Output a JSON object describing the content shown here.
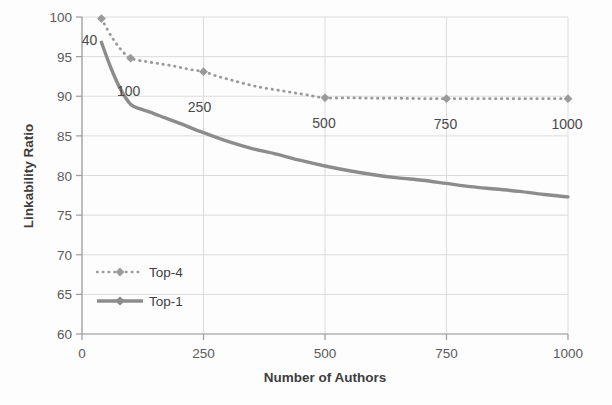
{
  "chart_data": {
    "type": "line",
    "title": "",
    "xlabel": "Number of Authors",
    "ylabel": "Linkability Ratio",
    "xlim": [
      0,
      1000
    ],
    "ylim": [
      60,
      100
    ],
    "xticks": [
      "0",
      "250",
      "500",
      "750",
      "1000"
    ],
    "xtick_values": [
      0,
      250,
      500,
      750,
      1000
    ],
    "yticks": [
      "60",
      "65",
      "70",
      "75",
      "80",
      "85",
      "90",
      "95",
      "100"
    ],
    "ytick_values": [
      60,
      65,
      70,
      75,
      80,
      85,
      90,
      95,
      100
    ],
    "grid": true,
    "legend_position": "inside-lower-left",
    "series": [
      {
        "name": "Top-4",
        "style": "dotted",
        "marker": "diamond",
        "color": "#9a9a9a",
        "x": [
          40,
          100,
          250,
          500,
          750,
          1000
        ],
        "values": [
          99.8,
          94.8,
          93.1,
          89.8,
          89.7,
          89.7
        ],
        "marker_x": [
          40,
          100,
          250,
          500,
          750,
          1000
        ],
        "dense_x": [
          40,
          60,
          80,
          100,
          130,
          160,
          190,
          220,
          250,
          280,
          310,
          340,
          370,
          400,
          430,
          460,
          500,
          550,
          600,
          650,
          700,
          750,
          800,
          850,
          900,
          950,
          1000
        ],
        "dense_values": [
          99.8,
          97.6,
          95.9,
          94.8,
          94.4,
          94.1,
          93.8,
          93.4,
          93.1,
          92.5,
          92.0,
          91.5,
          91.1,
          90.8,
          90.5,
          90.2,
          89.8,
          89.8,
          89.75,
          89.75,
          89.7,
          89.7,
          89.7,
          89.7,
          89.7,
          89.7,
          89.7
        ]
      },
      {
        "name": "Top-1",
        "style": "solid",
        "marker": "none",
        "color": "#8c8c8c",
        "x": [
          40,
          60,
          80,
          100,
          120,
          140,
          170,
          200,
          250,
          300,
          350,
          400,
          450,
          500,
          550,
          600,
          650,
          700,
          750,
          800,
          850,
          900,
          950,
          1000
        ],
        "values": [
          96.8,
          93.5,
          90.8,
          89.0,
          88.4,
          88.0,
          87.3,
          86.6,
          85.4,
          84.3,
          83.4,
          82.7,
          81.9,
          81.2,
          80.6,
          80.1,
          79.7,
          79.4,
          79.0,
          78.6,
          78.3,
          78.0,
          77.6,
          77.3
        ]
      }
    ],
    "annotations": [
      {
        "text": "40",
        "x": 40,
        "y": 99.8
      },
      {
        "text": "100",
        "x": 100,
        "y": 94.8
      },
      {
        "text": "250",
        "x": 250,
        "y": 93.1
      },
      {
        "text": "500",
        "x": 500,
        "y": 89.8
      },
      {
        "text": "750",
        "x": 750,
        "y": 89.7
      },
      {
        "text": "1000",
        "x": 1000,
        "y": 89.7
      }
    ]
  },
  "legend": {
    "entries": [
      {
        "label": "Top-4"
      },
      {
        "label": "Top-1"
      }
    ]
  },
  "colors": {
    "series_top4": "#9a9a9a",
    "series_top1": "#8c8c8c",
    "grid": "#d8d8d8",
    "axis": "#9c9c9c",
    "text": "#4a4a4a",
    "background": "#fdfdfd"
  }
}
